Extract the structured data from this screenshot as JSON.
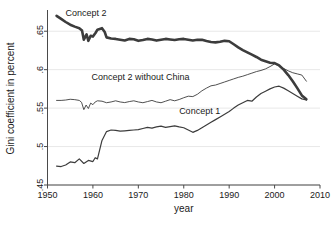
{
  "chart_data": {
    "type": "line",
    "title": "",
    "xlabel": "year",
    "ylabel": "Gini coefficient in percent",
    "xlim": [
      1950,
      2010
    ],
    "ylim": [
      0.45,
      0.675
    ],
    "xticks": [
      1950,
      1960,
      1970,
      1980,
      1990,
      2000,
      2010
    ],
    "xtick_labels": [
      "1950",
      "1960",
      "1970",
      "1980",
      "1990",
      "2000",
      "2010"
    ],
    "yticks": [
      0.45,
      0.5,
      0.55,
      0.6,
      0.65
    ],
    "ytick_labels": [
      ".45",
      ".5",
      ".55",
      ".6",
      ".65"
    ],
    "grid": true,
    "legend_position": "inline-annotations",
    "series": [
      {
        "name": "Concept 2",
        "label": "Concept 2",
        "label_x": 1958.5,
        "label_y": 0.6695,
        "color": "#3c3c3c",
        "line_width": 2.6,
        "x": [
          1952,
          1953,
          1954,
          1955,
          1956,
          1957,
          1957.6,
          1958,
          1958.6,
          1959,
          1959.5,
          1960,
          1960.6,
          1961,
          1962,
          1962.6,
          1963,
          1964,
          1965,
          1966,
          1967,
          1968,
          1969,
          1970,
          1971,
          1972,
          1973,
          1974,
          1975,
          1976,
          1977,
          1978,
          1979,
          1980,
          1981,
          1982,
          1983,
          1984,
          1985,
          1986,
          1987,
          1988,
          1989,
          1990,
          1991,
          1992,
          1993,
          1994,
          1995,
          1996,
          1997,
          1998,
          1999,
          2000,
          2001,
          2002,
          2003,
          2004,
          2005,
          2006,
          2007
        ],
        "y": [
          0.67,
          0.666,
          0.662,
          0.6585,
          0.656,
          0.654,
          0.651,
          0.639,
          0.646,
          0.6375,
          0.644,
          0.643,
          0.648,
          0.652,
          0.654,
          0.649,
          0.642,
          0.6405,
          0.64,
          0.639,
          0.638,
          0.64,
          0.6395,
          0.6375,
          0.6385,
          0.64,
          0.6392,
          0.6378,
          0.639,
          0.64,
          0.6392,
          0.6385,
          0.6395,
          0.64,
          0.639,
          0.638,
          0.6388,
          0.639,
          0.6372,
          0.636,
          0.6355,
          0.6362,
          0.6375,
          0.637,
          0.633,
          0.629,
          0.6255,
          0.6225,
          0.6195,
          0.6165,
          0.613,
          0.611,
          0.609,
          0.6085,
          0.6055,
          0.6,
          0.593,
          0.585,
          0.576,
          0.5665,
          0.5615
        ]
      },
      {
        "name": "Concept 2 without China",
        "label": "Concept 2 without China",
        "label_x": 1970.5,
        "label_y": 0.5865,
        "color": "#5a5a5a",
        "line_width": 0.9,
        "x": [
          1952,
          1953,
          1954,
          1955,
          1956,
          1957,
          1957.5,
          1958,
          1958.5,
          1959,
          1959.5,
          1960,
          1960.5,
          1961,
          1962,
          1963,
          1964,
          1965,
          1966,
          1967,
          1968,
          1969,
          1970,
          1971,
          1972,
          1973,
          1974,
          1975,
          1976,
          1977,
          1978,
          1979,
          1980,
          1981,
          1982,
          1983,
          1984,
          1985,
          1986,
          1987,
          1988,
          1989,
          1990,
          1991,
          1992,
          1993,
          1994,
          1995,
          1996,
          1997,
          1998,
          1999,
          2000,
          2001,
          2002,
          2003,
          2004,
          2005,
          2006,
          2007
        ],
        "y": [
          0.56,
          0.56,
          0.5605,
          0.5615,
          0.561,
          0.56,
          0.5575,
          0.548,
          0.554,
          0.5495,
          0.5565,
          0.5545,
          0.558,
          0.5595,
          0.559,
          0.557,
          0.558,
          0.5595,
          0.558,
          0.5572,
          0.5585,
          0.5595,
          0.558,
          0.557,
          0.5585,
          0.56,
          0.558,
          0.557,
          0.559,
          0.561,
          0.5595,
          0.5612,
          0.5635,
          0.5655,
          0.565,
          0.568,
          0.5725,
          0.576,
          0.579,
          0.58,
          0.582,
          0.584,
          0.586,
          0.588,
          0.59,
          0.5915,
          0.5935,
          0.5955,
          0.5975,
          0.599,
          0.601,
          0.604,
          0.6075,
          0.605,
          0.6015,
          0.5985,
          0.596,
          0.5945,
          0.593,
          0.585
        ]
      },
      {
        "name": "Concept 1",
        "label": "Concept 1",
        "label_x": 1983.5,
        "label_y": 0.5425,
        "color": "#3c3c3c",
        "line_width": 1.2,
        "x": [
          1952,
          1953,
          1954,
          1955,
          1956,
          1957,
          1958,
          1959,
          1960,
          1960.5,
          1961,
          1962,
          1963,
          1964,
          1965,
          1966,
          1967,
          1968,
          1969,
          1970,
          1971,
          1972,
          1973,
          1974,
          1975,
          1976,
          1977,
          1978,
          1979,
          1980,
          1981,
          1982,
          1983,
          1984,
          1985,
          1986,
          1987,
          1988,
          1989,
          1990,
          1991,
          1992,
          1993,
          1994,
          1995,
          1996,
          1997,
          1998,
          1999,
          2000,
          2001,
          2002,
          2003,
          2004,
          2005,
          2006,
          2007
        ],
        "y": [
          0.4745,
          0.474,
          0.476,
          0.48,
          0.479,
          0.484,
          0.478,
          0.482,
          0.4805,
          0.4855,
          0.484,
          0.508,
          0.5195,
          0.5215,
          0.521,
          0.52,
          0.5205,
          0.521,
          0.5215,
          0.522,
          0.5235,
          0.525,
          0.524,
          0.5255,
          0.5265,
          0.525,
          0.526,
          0.527,
          0.5255,
          0.5245,
          0.5215,
          0.5185,
          0.521,
          0.5245,
          0.528,
          0.5315,
          0.535,
          0.5385,
          0.542,
          0.5455,
          0.55,
          0.554,
          0.557,
          0.56,
          0.559,
          0.5645,
          0.569,
          0.572,
          0.575,
          0.5775,
          0.5785,
          0.576,
          0.5725,
          0.569,
          0.5655,
          0.562,
          0.5605
        ]
      }
    ]
  }
}
